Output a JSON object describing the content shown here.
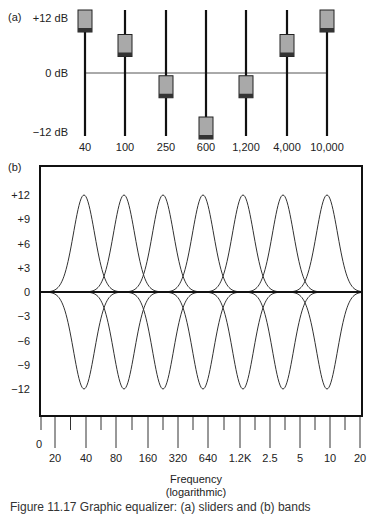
{
  "panel_a": {
    "label": "(a)",
    "y_labels": [
      "+12 dB",
      "0 dB",
      "−12 dB"
    ],
    "fader_freqs": [
      "40",
      "100",
      "250",
      "600",
      "1,200",
      "4,000",
      "10,000"
    ],
    "fader_gains_db": [
      12,
      6,
      -3,
      -12,
      -3,
      6,
      12
    ]
  },
  "panel_b": {
    "label": "(b)",
    "y_ticks": [
      "+12",
      "+9",
      "+6",
      "+3",
      "0",
      "−3",
      "−6",
      "−9",
      "−12"
    ],
    "x_zero_label": "0",
    "x_tick_labels": [
      "20",
      "40",
      "80",
      "160",
      "320",
      "640",
      "1.2K",
      "2.5",
      "5",
      "10",
      "20"
    ],
    "xlabel_line1": "Frequency",
    "xlabel_line2": "(logarithmic)"
  },
  "caption": "Figure 11.17  Graphic equalizer: (a) sliders and (b) bands",
  "chart_data": [
    {
      "type": "bar",
      "title": "(a) Graphic equalizer fader positions",
      "categories": [
        "40",
        "100",
        "250",
        "600",
        "1,200",
        "4,000",
        "10,000"
      ],
      "values": [
        12,
        6,
        -3,
        -12,
        -3,
        6,
        12
      ],
      "ylabel": "Gain (dB)",
      "ylim": [
        -12,
        12
      ],
      "y_tick_labels": [
        "+12 dB",
        "0 dB",
        "−12 dB"
      ]
    },
    {
      "type": "line",
      "title": "(b) Band responses",
      "xlabel": "Frequency (logarithmic)",
      "ylabel": "Gain (dB)",
      "ylim": [
        -12,
        12
      ],
      "y_ticks": [
        12,
        9,
        6,
        3,
        0,
        -3,
        -6,
        -9,
        -12
      ],
      "x_tick_labels": [
        "20",
        "40",
        "80",
        "160",
        "320",
        "640",
        "1.2K",
        "2.5",
        "5",
        "10",
        "20"
      ],
      "grid": false,
      "series": [
        {
          "name": "boost curves",
          "peak_db": 12,
          "count": 7
        },
        {
          "name": "cut curves",
          "peak_db": -12,
          "count": 7
        }
      ]
    }
  ]
}
